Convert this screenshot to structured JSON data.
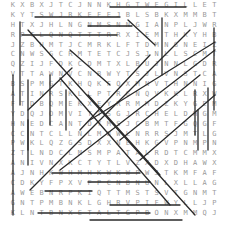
{
  "puzzle": {
    "type": "word-search",
    "cols": 22,
    "rows": 22,
    "grid": [
      "KXBXJTCJNNKHGTWEGILLETTEICWVV",
      "KYTSWJRKEFEJBLSBKXMMBTTJXHL",
      "HTXJHLNGNMSNNGIANPLJWRVWGJNE",
      "RPTLQNQTTTRRXIEMTHKYHBRWKPAD",
      "JZBHMTJCMRKLFTDMNGNEIZYJRXGJ",
      "CNWSGCRMTETCJSJNLLSCMTNKAEX",
      "QZIJFDKCDMTXLBUJNNLGDRFIJWHL",
      "VTTAWNVCNBWYTSJLVNSTCAMCRKYN",
      "BSPMGTKHQKFQXMNVTHNNIGEVHWZT",
      "ATINRSKLLPTRGNQVKKLRXWIDBJY",
      "FTDBQMEKXEYRRMMDZKYGEMDGXEH",
      "YDQJOMVITTSGJRCHELDHGMGKRI",
      "HNEDCANTDYMSJCBMTFGQGFQMBSY",
      "CCNTCLLNLMBWLNRRSJMTLGDTUXE",
      "PWKLQZGSDXXNEHKGVPNMPNZDFM",
      "ZTLNDCLMSMPATALRDTCMMXTMXHT",
      "ANIVNXKCTYTLVZXDXDHAWXDHV",
      "AJNHKWHMHKWKWPWJTKMFAFGRZTY",
      "CDKYFPXVFPCNBNUNLXLLAGMJKZMD",
      "AWEBNRPKIQTTMSTSVTGNMTTVLRQLTT",
      "GNTPMBNKLGHRVPIFWYLLJPQMTZK",
      "KLNTBNXETALTGPBONXMMQJYTWKY"
    ],
    "found_words_visible": [
      "GILLETTE",
      "KEEPING",
      "ASIA",
      "MIRAGE",
      "ALTEPOPO",
      "MERCEDES",
      "BEREE",
      "JOOMICK",
      "HARRISON",
      "MALLAGEGRAPE"
    ],
    "line_color": "#2a2a2a",
    "letter_color": "#9a9a9a",
    "background": "#ffffff"
  }
}
